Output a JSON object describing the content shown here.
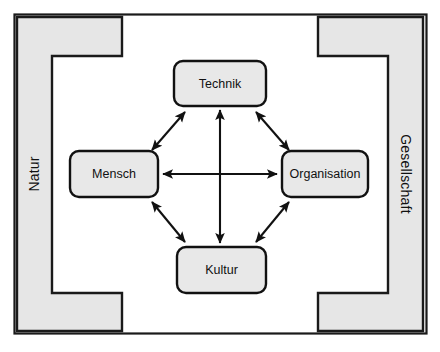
{
  "diagram": {
    "type": "relationship-diagram",
    "frame": {
      "name": "outer-frame",
      "stroke_color": "#1a1a1a",
      "fill_color": "#ffffff"
    },
    "context_brackets": [
      {
        "id": "natur",
        "label": "Natur",
        "side": "left",
        "orientation": "vertical-ccw",
        "fill_color": "#e6e6e6",
        "stroke_color": "#1a1a1a"
      },
      {
        "id": "gesellschaft",
        "label": "Gesellschaft",
        "side": "right",
        "orientation": "vertical-cw",
        "fill_color": "#e6e6e6",
        "stroke_color": "#1a1a1a"
      }
    ],
    "nodes": [
      {
        "id": "technik",
        "label": "Technik",
        "position": "top",
        "fill_color": "#e8e8e8",
        "stroke_color": "#111111"
      },
      {
        "id": "mensch",
        "label": "Mensch",
        "position": "left",
        "fill_color": "#e8e8e8",
        "stroke_color": "#111111"
      },
      {
        "id": "organisation",
        "label": "Organisation",
        "position": "right",
        "fill_color": "#e8e8e8",
        "stroke_color": "#111111"
      },
      {
        "id": "kultur",
        "label": "Kultur",
        "position": "bottom",
        "fill_color": "#e8e8e8",
        "stroke_color": "#111111"
      }
    ],
    "connections": [
      {
        "id": "mensch-technik",
        "from": "mensch",
        "to": "technik",
        "style": "double-arrow",
        "geometry": "diagonal"
      },
      {
        "id": "technik-organisation",
        "from": "technik",
        "to": "organisation",
        "style": "double-arrow",
        "geometry": "diagonal"
      },
      {
        "id": "organisation-kultur",
        "from": "organisation",
        "to": "kultur",
        "style": "double-arrow",
        "geometry": "diagonal"
      },
      {
        "id": "kultur-mensch",
        "from": "kultur",
        "to": "mensch",
        "style": "double-arrow",
        "geometry": "diagonal"
      },
      {
        "id": "mensch-organisation",
        "from": "mensch",
        "to": "organisation",
        "style": "double-arrow",
        "geometry": "horizontal"
      },
      {
        "id": "technik-kultur",
        "from": "technik",
        "to": "kultur",
        "style": "double-arrow",
        "geometry": "vertical"
      }
    ],
    "colors": {
      "line": "#111111",
      "node_fill": "#e8e8e8",
      "bracket_fill": "#e6e6e6",
      "background": "#ffffff"
    }
  }
}
